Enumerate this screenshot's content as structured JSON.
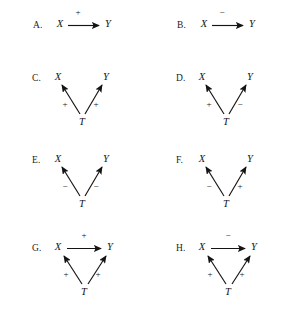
{
  "figure": {
    "type": "causal-diagram-grid",
    "background_color": "#ffffff",
    "line_color": "#141414",
    "columns": 2,
    "rows": 4,
    "nodes_used": [
      "X",
      "Y",
      "T"
    ],
    "signs_used": [
      "+",
      "−"
    ]
  },
  "panels": [
    {
      "id": "A",
      "label": "A.",
      "layout": "horizontal",
      "nodes": {
        "left": "X",
        "right": "Y"
      },
      "edges": [
        {
          "from": "X",
          "to": "Y",
          "sign": "+",
          "direction": "right"
        }
      ]
    },
    {
      "id": "B",
      "label": "B.",
      "layout": "horizontal",
      "nodes": {
        "left": "X",
        "right": "Y"
      },
      "edges": [
        {
          "from": "X",
          "to": "Y",
          "sign": "−",
          "direction": "right"
        }
      ]
    },
    {
      "id": "C",
      "label": "C.",
      "layout": "fork",
      "nodes": {
        "left": "X",
        "right": "Y",
        "bottom": "T"
      },
      "edges": [
        {
          "from": "T",
          "to": "X",
          "sign": "+",
          "direction": "up-left"
        },
        {
          "from": "T",
          "to": "Y",
          "sign": "+",
          "direction": "up-right"
        }
      ]
    },
    {
      "id": "D",
      "label": "D.",
      "layout": "fork",
      "nodes": {
        "left": "X",
        "right": "Y",
        "bottom": "T"
      },
      "edges": [
        {
          "from": "T",
          "to": "X",
          "sign": "+",
          "direction": "up-left"
        },
        {
          "from": "T",
          "to": "Y",
          "sign": "−",
          "direction": "up-right"
        }
      ]
    },
    {
      "id": "E",
      "label": "E.",
      "layout": "fork",
      "nodes": {
        "left": "X",
        "right": "Y",
        "bottom": "T"
      },
      "edges": [
        {
          "from": "T",
          "to": "X",
          "sign": "−",
          "direction": "up-left"
        },
        {
          "from": "T",
          "to": "Y",
          "sign": "−",
          "direction": "up-right"
        }
      ]
    },
    {
      "id": "F",
      "label": "F.",
      "layout": "fork",
      "nodes": {
        "left": "X",
        "right": "Y",
        "bottom": "T"
      },
      "edges": [
        {
          "from": "T",
          "to": "X",
          "sign": "−",
          "direction": "up-left"
        },
        {
          "from": "T",
          "to": "Y",
          "sign": "+",
          "direction": "up-right"
        }
      ]
    },
    {
      "id": "G",
      "label": "G.",
      "layout": "triangle",
      "nodes": {
        "left": "X",
        "right": "Y",
        "bottom": "T"
      },
      "edges": [
        {
          "from": "X",
          "to": "Y",
          "sign": "+",
          "direction": "right"
        },
        {
          "from": "T",
          "to": "X",
          "sign": "+",
          "direction": "up-left"
        },
        {
          "from": "T",
          "to": "Y",
          "sign": "+",
          "direction": "up-right"
        }
      ]
    },
    {
      "id": "H",
      "label": "H.",
      "layout": "triangle",
      "nodes": {
        "left": "X",
        "right": "Y",
        "bottom": "T"
      },
      "edges": [
        {
          "from": "X",
          "to": "Y",
          "sign": "−",
          "direction": "right"
        },
        {
          "from": "T",
          "to": "X",
          "sign": "+",
          "direction": "up-left"
        },
        {
          "from": "T",
          "to": "Y",
          "sign": "+",
          "direction": "up-right"
        }
      ]
    }
  ]
}
